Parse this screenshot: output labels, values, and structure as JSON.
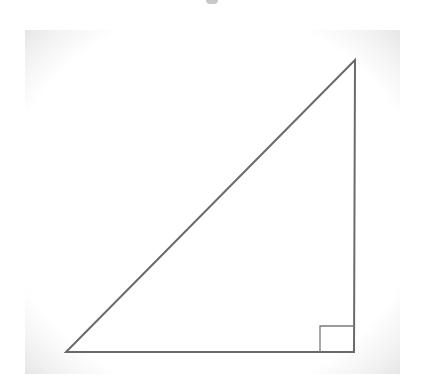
{
  "diagram": {
    "type": "right-triangle",
    "colors": {
      "stroke": "#6a6a6a",
      "background": "#ffffff",
      "panel_edge": "#e6e6e6"
    },
    "vertices": {
      "bottom_left": [
        66,
        352
      ],
      "bottom_right": [
        354,
        352
      ],
      "top_right": [
        355,
        60
      ]
    },
    "right_angle_marker": {
      "corner": "bottom_right",
      "size": 34
    },
    "labels": []
  }
}
